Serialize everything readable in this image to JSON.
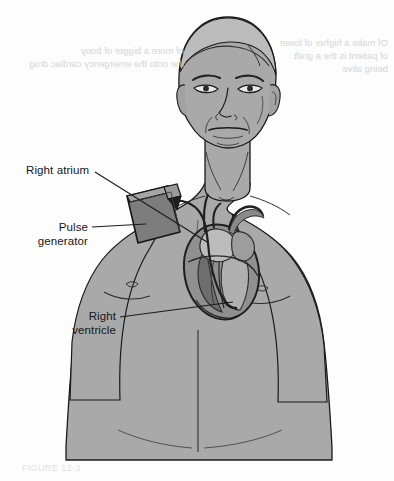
{
  "labels": [
    {
      "id": "right-atrium",
      "text": "Right atrium"
    },
    {
      "id": "pulse-generator",
      "text": "Pulse\ngenerator"
    },
    {
      "id": "right-ventricle",
      "text": "Right\nventricle"
    }
  ],
  "bleed_through": {
    "left_block": "of more a bigger of bony\nthe onto the emergency cardiac drug",
    "right_block": "Of make a higher of lower\nof patient is the a graft\nbeing alive",
    "caption": "FIGURE 12-3"
  },
  "colors": {
    "skin_fill": "#a9a9a9",
    "skin_shadow": "#969696",
    "skin_highlight": "#bdbdbd",
    "outline": "#1a1a1a",
    "device_fill": "#7d7d7d",
    "device_dark": "#2b2b2b",
    "heart_fill": "#8c8c8c",
    "heart_dark": "#4a4a4a",
    "background": "#fdfdfd",
    "bleed_text": "#cfcfcf",
    "label_text": "#17171a"
  }
}
